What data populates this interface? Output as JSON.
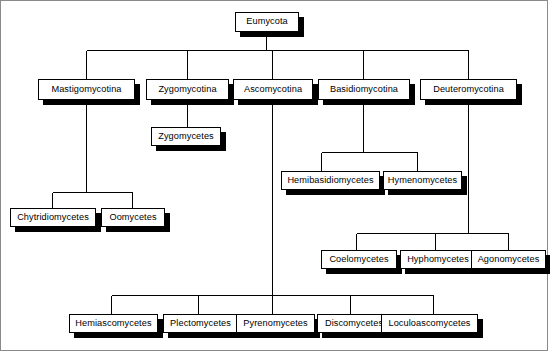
{
  "diagram": {
    "background_color": "#ffffff",
    "box_fill_color": "#ffffff",
    "box_border_color": "#000000",
    "shadow_color": "#000000",
    "line_color": "#000000",
    "frame_color": "#8a8a8a"
  },
  "nodes": [
    {
      "id": "eumycota",
      "label": "Eumycota",
      "level": 0,
      "x": 235,
      "y": 12,
      "w": 64,
      "h": 20
    },
    {
      "id": "mastigomycotina",
      "label": "Mastigomycotina",
      "level": 1,
      "x": 38,
      "y": 79,
      "w": 97,
      "h": 21
    },
    {
      "id": "zygomycotina",
      "label": "Zygomycotina",
      "level": 1,
      "x": 146,
      "y": 79,
      "w": 83,
      "h": 21
    },
    {
      "id": "ascomycotina",
      "label": "Ascomycotina",
      "level": 1,
      "x": 233,
      "y": 79,
      "w": 80,
      "h": 21
    },
    {
      "id": "basidiomycotina",
      "label": "Basidiomycotina",
      "level": 1,
      "x": 318,
      "y": 79,
      "w": 92,
      "h": 21
    },
    {
      "id": "deuteromycotina",
      "label": "Deuteromycotina",
      "level": 1,
      "x": 420,
      "y": 79,
      "w": 97,
      "h": 21
    },
    {
      "id": "zygomycetes",
      "label": "Zygomycetes",
      "level": 2,
      "x": 151,
      "y": 127,
      "w": 70,
      "h": 19
    },
    {
      "id": "hemibasidiomycetes",
      "label": "Hemibasidiomycetes",
      "level": 2,
      "x": 281,
      "y": 171,
      "w": 99,
      "h": 19
    },
    {
      "id": "hymenomycetes",
      "label": "Hymenomycetes",
      "level": 2,
      "x": 383,
      "y": 171,
      "w": 79,
      "h": 19
    },
    {
      "id": "chytridiomycetes",
      "label": "Chytridiomycetes",
      "level": 2,
      "x": 10,
      "y": 208,
      "w": 86,
      "h": 19
    },
    {
      "id": "oomycetes",
      "label": "Oomycetes",
      "level": 2,
      "x": 101,
      "y": 208,
      "w": 64,
      "h": 19
    },
    {
      "id": "coelomycetes",
      "label": "Coelomycetes",
      "level": 2,
      "x": 321,
      "y": 250,
      "w": 76,
      "h": 19
    },
    {
      "id": "hyphomycetes",
      "label": "Hyphomycetes",
      "level": 2,
      "x": 400,
      "y": 250,
      "w": 76,
      "h": 19
    },
    {
      "id": "agonomycetes",
      "label": "Agonomycetes",
      "level": 2,
      "x": 471,
      "y": 250,
      "w": 75,
      "h": 19
    },
    {
      "id": "hemiascomycetes",
      "label": "Hemiascomycetes",
      "level": 2,
      "x": 69,
      "y": 314,
      "w": 89,
      "h": 19
    },
    {
      "id": "plectomycetes",
      "label": "Plectomycetes",
      "level": 2,
      "x": 163,
      "y": 314,
      "w": 75,
      "h": 19
    },
    {
      "id": "pyrenomycetes",
      "label": "Pyrenomycetes",
      "level": 2,
      "x": 236,
      "y": 314,
      "w": 79,
      "h": 19
    },
    {
      "id": "discomycetes",
      "label": "Discomycetes",
      "level": 2,
      "x": 317,
      "y": 314,
      "w": 74,
      "h": 19
    },
    {
      "id": "loculoascomycetes",
      "label": "Loculoascomycetes",
      "level": 2,
      "x": 381,
      "y": 314,
      "w": 97,
      "h": 19
    }
  ],
  "edges": [
    {
      "from": "eumycota",
      "to": [
        "mastigomycotina",
        "zygomycotina",
        "ascomycotina",
        "basidiomycotina",
        "deuteromycotina"
      ]
    },
    {
      "from": "zygomycotina",
      "to": [
        "zygomycetes"
      ]
    },
    {
      "from": "mastigomycotina",
      "to": [
        "chytridiomycetes",
        "oomycetes"
      ]
    },
    {
      "from": "basidiomycotina",
      "to": [
        "hemibasidiomycetes",
        "hymenomycetes"
      ]
    },
    {
      "from": "deuteromycotina",
      "to": [
        "coelomycetes",
        "hyphomycetes",
        "agonomycetes"
      ]
    },
    {
      "from": "ascomycotina",
      "to": [
        "hemiascomycetes",
        "plectomycetes",
        "pyrenomycetes",
        "discomycetes",
        "loculoascomycetes"
      ]
    }
  ]
}
